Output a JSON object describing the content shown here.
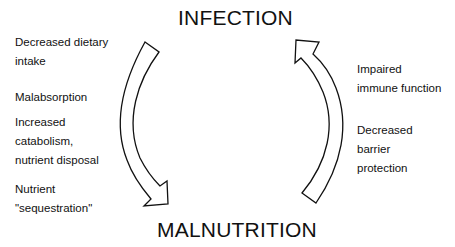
{
  "diagram": {
    "top_node": "INFECTION",
    "bottom_node": "MALNUTRITION",
    "left_arrow": {
      "direction": "infection-to-malnutrition",
      "labels": [
        [
          "Decreased dietary",
          "intake"
        ],
        [
          "Malabsorption"
        ],
        [
          "Increased",
          "catabolism,",
          "nutrient disposal"
        ],
        [
          "Nutrient",
          "\"sequestration\""
        ]
      ]
    },
    "right_arrow": {
      "direction": "malnutrition-to-infection",
      "labels": [
        [
          "Impaired",
          "immune function"
        ],
        [
          "Decreased",
          "barrier",
          "protection"
        ]
      ]
    }
  }
}
